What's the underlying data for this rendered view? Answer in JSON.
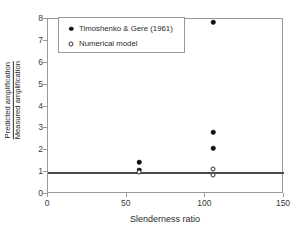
{
  "chart_data": {
    "type": "scatter",
    "title": "",
    "xlabel": "Slenderness ratio",
    "ylabel_numerator": "Predicted amplification",
    "ylabel_denominator": "Measured amplification",
    "xlim": [
      0,
      150
    ],
    "ylim": [
      0,
      8
    ],
    "xticks": [
      0,
      50,
      100,
      150
    ],
    "yticks": [
      0,
      1,
      2,
      3,
      4,
      5,
      6,
      7,
      8
    ],
    "xtick_labels": [
      "0",
      "50",
      "100",
      "150"
    ],
    "ytick_labels": [
      "0",
      "1",
      "2",
      "3",
      "4",
      "5",
      "6",
      "7",
      "8"
    ],
    "grid": false,
    "legend_position": "upper-left-inside",
    "reference_line": {
      "orientation": "horizontal",
      "value": 1,
      "color": "#4a4a4a",
      "width_px": 2
    },
    "series": [
      {
        "name": "Timoshenko & Gere (1961)",
        "marker": "filled-circle",
        "color": "#111111",
        "points": [
          {
            "x": 58,
            "y": 1.45
          },
          {
            "x": 58,
            "y": 1.1
          },
          {
            "x": 105,
            "y": 7.85
          },
          {
            "x": 105,
            "y": 2.82
          },
          {
            "x": 105,
            "y": 2.1
          }
        ]
      },
      {
        "name": "Numerical model",
        "marker": "open-circle",
        "color": "#2b2b2b",
        "points": [
          {
            "x": 58,
            "y": 1.0
          },
          {
            "x": 105,
            "y": 1.15
          },
          {
            "x": 105,
            "y": 0.85
          }
        ]
      }
    ]
  }
}
